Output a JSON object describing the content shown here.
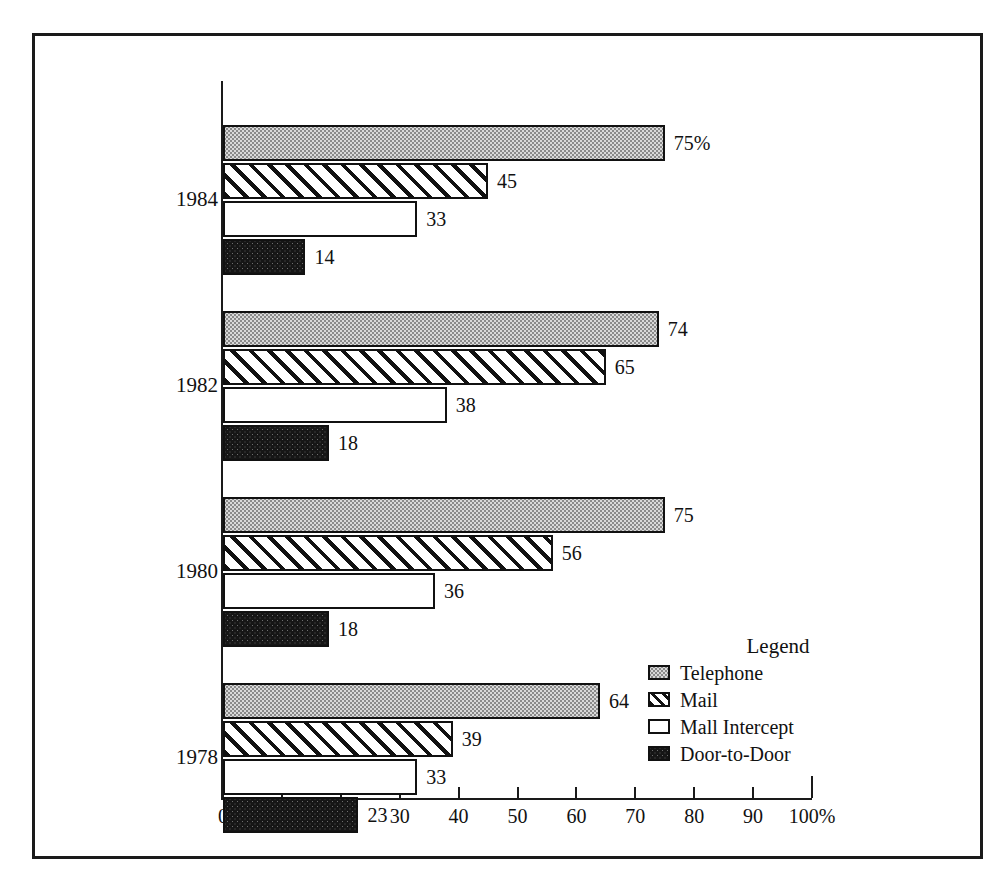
{
  "figure": {
    "caption": "",
    "legend_title": "Legend"
  },
  "axis": {
    "unit_suffix": "%",
    "tick_labels": [
      "0",
      "10",
      "20",
      "30",
      "40",
      "50",
      "60",
      "70",
      "80",
      "90",
      "100%"
    ],
    "tick_values": [
      0,
      10,
      20,
      30,
      40,
      50,
      60,
      70,
      80,
      90,
      100
    ]
  },
  "colors": {
    "ink": "#111111",
    "frame": "#1a1a1a",
    "telephone_fill": "#d9d9d9",
    "mail_fill": "#ffffff",
    "mall_intercept_fill": "#ffffff",
    "door_to_door_fill": "#161616"
  },
  "legend": {
    "title": "Legend",
    "entries": [
      {
        "label": "Telephone",
        "pattern": "stipple-light",
        "swatch": "telephone-swatch"
      },
      {
        "label": "Mail",
        "pattern": "diagonal-hatch",
        "swatch": "mail-swatch"
      },
      {
        "label": "Mall Intercept",
        "pattern": "solid-white",
        "swatch": "mall-intercept-swatch"
      },
      {
        "label": "Door-to-Door",
        "pattern": "stipple-dark",
        "swatch": "door-to-door-swatch"
      }
    ]
  },
  "chart_data": {
    "type": "bar",
    "orientation": "horizontal",
    "title": "",
    "subtitle": "",
    "xlabel": "",
    "ylabel": "",
    "xlim": [
      0,
      100
    ],
    "grid": false,
    "legend_position": "bottom-right",
    "categories": [
      "1984",
      "1982",
      "1980",
      "1978"
    ],
    "series": [
      {
        "name": "Telephone",
        "values": [
          75,
          74,
          75,
          64
        ]
      },
      {
        "name": "Mail",
        "values": [
          45,
          65,
          56,
          39
        ]
      },
      {
        "name": "Mall Intercept",
        "values": [
          33,
          38,
          36,
          33
        ]
      },
      {
        "name": "Door-to-Door",
        "values": [
          14,
          18,
          18,
          23
        ]
      }
    ],
    "data_labels": [
      {
        "category": "1984",
        "series": "Telephone",
        "text": "75%"
      },
      {
        "category": "1984",
        "series": "Mail",
        "text": "45"
      },
      {
        "category": "1984",
        "series": "Mall Intercept",
        "text": "33"
      },
      {
        "category": "1984",
        "series": "Door-to-Door",
        "text": "14"
      },
      {
        "category": "1982",
        "series": "Telephone",
        "text": "74"
      },
      {
        "category": "1982",
        "series": "Mail",
        "text": "65"
      },
      {
        "category": "1982",
        "series": "Mall Intercept",
        "text": "38"
      },
      {
        "category": "1982",
        "series": "Door-to-Door",
        "text": "18"
      },
      {
        "category": "1980",
        "series": "Telephone",
        "text": "75"
      },
      {
        "category": "1980",
        "series": "Mail",
        "text": "56"
      },
      {
        "category": "1980",
        "series": "Mall Intercept",
        "text": "36"
      },
      {
        "category": "1980",
        "series": "Door-to-Door",
        "text": "18"
      },
      {
        "category": "1978",
        "series": "Telephone",
        "text": "64"
      },
      {
        "category": "1978",
        "series": "Mail",
        "text": "39"
      },
      {
        "category": "1978",
        "series": "Mall Intercept",
        "text": "33"
      },
      {
        "category": "1978",
        "series": "Door-to-Door",
        "text": "23"
      }
    ]
  }
}
